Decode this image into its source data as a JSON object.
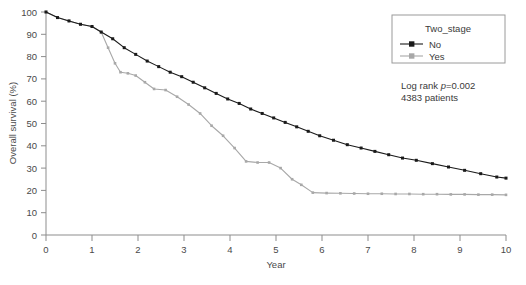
{
  "chart_data": {
    "type": "line",
    "title": "",
    "xlabel": "Year",
    "ylabel": "Overall survival (%)",
    "xlim": [
      0,
      10
    ],
    "ylim": [
      0,
      100
    ],
    "xticks": [
      "0",
      "1",
      "2",
      "3",
      "4",
      "5",
      "6",
      "7",
      "8",
      "9",
      "10"
    ],
    "yticks": [
      "0",
      "10",
      "20",
      "30",
      "40",
      "50",
      "60",
      "70",
      "80",
      "90",
      "100"
    ],
    "grid": false,
    "legend_position": "top-right",
    "legend_title": "Two_stage",
    "series": [
      {
        "name": "No",
        "color": "#1a1a1a",
        "x": [
          0,
          0.25,
          0.5,
          0.75,
          1.0,
          1.2,
          1.45,
          1.7,
          1.95,
          2.2,
          2.45,
          2.7,
          2.95,
          3.2,
          3.45,
          3.7,
          3.95,
          4.2,
          4.45,
          4.7,
          4.95,
          5.2,
          5.45,
          5.7,
          5.95,
          6.25,
          6.55,
          6.85,
          7.15,
          7.45,
          7.75,
          8.05,
          8.4,
          8.75,
          9.1,
          9.45,
          9.8,
          10.0
        ],
        "y": [
          100,
          97.5,
          96,
          94.5,
          93.5,
          91,
          88,
          84,
          81,
          78,
          75.5,
          73,
          71,
          68.5,
          66,
          63.5,
          61,
          59,
          56.5,
          54.5,
          52.5,
          50.5,
          48.5,
          46.5,
          44.5,
          42.5,
          40.5,
          39,
          37.5,
          36,
          34.5,
          33.5,
          32,
          30.5,
          29,
          27.5,
          26,
          25.5
        ]
      },
      {
        "name": "Yes",
        "color": "#a8a8a8",
        "x": [
          0,
          0.25,
          0.5,
          0.75,
          1.0,
          1.2,
          1.35,
          1.5,
          1.62,
          1.78,
          1.95,
          2.15,
          2.35,
          2.6,
          2.85,
          3.1,
          3.35,
          3.6,
          3.85,
          4.1,
          4.35,
          4.6,
          4.85,
          5.1,
          5.35,
          5.55,
          5.8,
          6.1,
          6.4,
          6.7,
          7.0,
          7.3,
          7.6,
          7.9,
          8.2,
          8.5,
          8.8,
          9.1,
          9.4,
          9.7,
          10.0
        ],
        "y": [
          100,
          97.5,
          96,
          94.5,
          93.5,
          91,
          84,
          77,
          73,
          72.5,
          71.5,
          68.5,
          65.5,
          65,
          62,
          58.5,
          54.5,
          49,
          44.5,
          39,
          33,
          32.5,
          32.5,
          30,
          25,
          22.5,
          19,
          18.8,
          18.7,
          18.6,
          18.5,
          18.5,
          18.4,
          18.4,
          18.3,
          18.3,
          18.2,
          18.2,
          18.1,
          18.1,
          18
        ]
      }
    ],
    "annotations": [
      {
        "id": "logrank",
        "text_prefix": "Log rank ",
        "text_italic": "p",
        "text_suffix": "=0.002"
      },
      {
        "id": "patients",
        "text": "4383 patients"
      }
    ]
  }
}
